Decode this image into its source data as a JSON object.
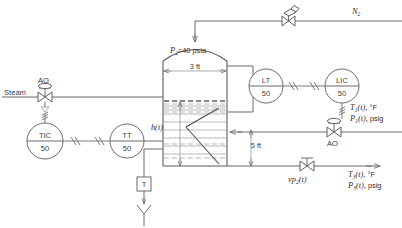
{
  "diagram": {
    "type": "process-and-instrumentation-diagram",
    "colors": {
      "line": "#6b6b6b",
      "vessel": "#5a5a5a",
      "text": "#3a3a3a",
      "liquid": "#9c9c9c",
      "background": "#ffffff"
    }
  },
  "vessel": {
    "pressure_label": "=40 psia",
    "pressure_symbol": "P",
    "pressure_subscript": "2",
    "diameter_label": "3 ft",
    "height_label": "5 ft",
    "level_symbol": "h",
    "level_arg": "(t)"
  },
  "streams": {
    "steam_inlet_label": "Steam",
    "nitrogen_label": "N",
    "nitrogen_subscript": "2",
    "inlet_temp_symbol": "T",
    "inlet_temp_subscript": "1",
    "inlet_temp_arg": "(t),",
    "inlet_temp_unit": "°F",
    "inlet_pres_symbol": "P",
    "inlet_pres_subscript": "1",
    "inlet_pres_arg": "(t),",
    "inlet_pres_unit": "psig",
    "outlet_temp_symbol": "T",
    "outlet_temp_subscript": "3",
    "outlet_temp_arg": "(t),",
    "outlet_temp_unit": "°F",
    "outlet_pres_symbol": "P",
    "outlet_pres_subscript": "3",
    "outlet_pres_arg": "(t),",
    "outlet_pres_unit": "psig"
  },
  "valves": [
    {
      "id": "steam-valve",
      "action_label": "AO",
      "position": "steam-inlet",
      "kind": "diaphragm-control-valve"
    },
    {
      "id": "nitrogen-valve",
      "action_label": "",
      "position": "nitrogen-header",
      "kind": "hand-operated-valve"
    },
    {
      "id": "feed-valve",
      "action_label": "AO",
      "position": "feed-inlet",
      "kind": "diaphragm-control-valve"
    },
    {
      "id": "outlet-valve",
      "action_label": "",
      "position": "product-outlet",
      "kind": "diaphragm-control-valve",
      "signal_symbol": "vp",
      "signal_subscript": "2",
      "signal_arg": "(t)"
    }
  ],
  "instruments": [
    {
      "id": "tic-50",
      "tag_top": "TIC",
      "tag_bottom": "50",
      "name": "temperature-indicating-controller"
    },
    {
      "id": "tt-50",
      "tag_top": "TT",
      "tag_bottom": "50",
      "name": "temperature-transmitter"
    },
    {
      "id": "lt-50",
      "tag_top": "LT",
      "tag_bottom": "50",
      "name": "level-transmitter"
    },
    {
      "id": "lic-50",
      "tag_top": "LIC",
      "tag_bottom": "50",
      "name": "level-indicating-controller"
    }
  ],
  "elements": {
    "thermowell_label": "T"
  }
}
